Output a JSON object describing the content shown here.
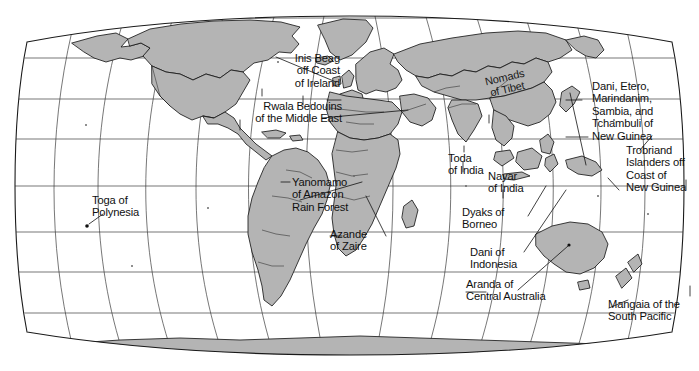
{
  "map": {
    "title": "World map of cultures referenced in cross-cultural studies",
    "projection": "oval pseudocylindrical (Robinson-style) world projection",
    "land_color": "#b4b4b4",
    "ocean_color": "#ffffff",
    "outline_color": "#1a1a1a",
    "graticule_color": "#3c3c3c",
    "label_color": "#101010",
    "graticule": {
      "parallel_spacing_deg": 30,
      "meridian_spacing_deg": 30
    }
  },
  "labels": [
    {
      "id": "inis-beag",
      "text": "Inis Beag\noff Coast\nof Ireland"
    },
    {
      "id": "rwala",
      "text": "Rwala Bedouins\nof the Middle East"
    },
    {
      "id": "nomads-tibet",
      "text": "Nomads\nof Tibet"
    },
    {
      "id": "new-guinea",
      "text": "Dani, Etero,\nMarindanim,\nSambia, and\nTchambuli of\nNew Guinea"
    },
    {
      "id": "trobriand",
      "text": "Trobriand\nIslanders off\nCoast of\nNew Guinea"
    },
    {
      "id": "toda",
      "text": "Toda\nof India"
    },
    {
      "id": "nayar",
      "text": "Nayar\nof India"
    },
    {
      "id": "dyaks",
      "text": "Dyaks of\nBorneo"
    },
    {
      "id": "dani-indo",
      "text": "Dani of\nIndonesia"
    },
    {
      "id": "toga",
      "text": "Toga of\nPolynesia"
    },
    {
      "id": "yanomamo",
      "text": "Yanomamo\nof Amazon\nRain Forest"
    },
    {
      "id": "azande",
      "text": "Azande\nof Zaire"
    },
    {
      "id": "aranda",
      "text": "Aranda of\nCentral Australia"
    },
    {
      "id": "mangaia",
      "text": "Mangaia of the\nSouth Pacific"
    }
  ]
}
